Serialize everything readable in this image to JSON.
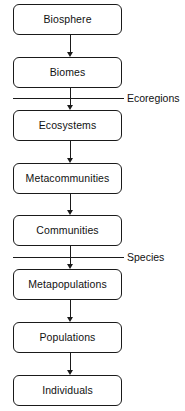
{
  "diagram": {
    "background_color": "#ffffff",
    "stroke_color": "#1a1a1a",
    "text_color": "#111111",
    "nodes": [
      {
        "label": "Biosphere",
        "x": 13,
        "y": 4,
        "w": 109,
        "h": 31
      },
      {
        "label": "Biomes",
        "x": 13,
        "y": 57,
        "w": 109,
        "h": 31
      },
      {
        "label": "Ecosystems",
        "x": 13,
        "y": 110,
        "w": 109,
        "h": 31
      },
      {
        "label": "Metacommunities",
        "x": 13,
        "y": 163,
        "w": 109,
        "h": 31
      },
      {
        "label": "Communities",
        "x": 13,
        "y": 215,
        "w": 109,
        "h": 31
      },
      {
        "label": "Metapopulations",
        "x": 13,
        "y": 269,
        "w": 109,
        "h": 31
      },
      {
        "label": "Populations",
        "x": 13,
        "y": 322,
        "w": 109,
        "h": 31
      },
      {
        "label": "Individuals",
        "x": 13,
        "y": 375,
        "w": 109,
        "h": 31
      }
    ],
    "connectors": [
      {
        "from": "Biosphere",
        "to": "Biomes",
        "y": 35,
        "height": 22
      },
      {
        "from": "Biomes",
        "to": "Ecosystems",
        "y": 88,
        "height": 22
      },
      {
        "from": "Ecosystems",
        "to": "Metacommunities",
        "y": 141,
        "height": 22
      },
      {
        "from": "Metacommunities",
        "to": "Communities",
        "y": 194,
        "height": 21
      },
      {
        "from": "Communities",
        "to": "Metapopulations",
        "y": 246,
        "height": 23
      },
      {
        "from": "Metapopulations",
        "to": "Populations",
        "y": 300,
        "height": 22
      },
      {
        "from": "Populations",
        "to": "Individuals",
        "y": 353,
        "height": 22
      }
    ],
    "dividers": [
      {
        "label": "Ecoregions",
        "line_y": 98,
        "label_x": 127,
        "label_y": 93
      },
      {
        "label": "Species",
        "line_y": 257,
        "label_x": 127,
        "label_y": 252
      }
    ]
  }
}
